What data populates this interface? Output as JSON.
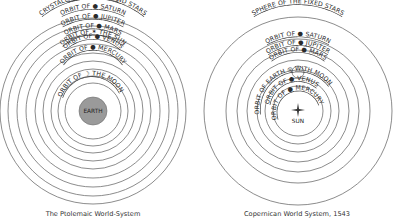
{
  "ptolemaic": {
    "caption": "The Ptolemaic World-System",
    "center_label": "EARTH",
    "earth_fill": "#9a9a9a",
    "rings": [
      {
        "label": "PRIMUM MOBILE"
      },
      {
        "label": "CRYSTALLINE HEAVENS AND STARS"
      },
      {
        "label": "ORBIT OF ● SATURN"
      },
      {
        "label": "ORBIT OF ● JUPITER"
      },
      {
        "label": "ORBIT OF ● MARS"
      },
      {
        "label": "ORBIT OF ✶ THE SUN"
      },
      {
        "label": "ORBIT OF ● VENUS"
      },
      {
        "label": "ORBIT OF ● MERCURY"
      },
      {
        "label": "ORBIT OF ☽ THE MOON"
      }
    ]
  },
  "copernican": {
    "caption": "Copernican World System, 1543",
    "center_label": "SUN",
    "rings": [
      {
        "label": "SPHERE OF THE FIXED STARS"
      },
      {
        "label": "ORBIT OF ● SATURN"
      },
      {
        "label": "ORBIT OF ● JUPITER"
      },
      {
        "label": "ORBIT OF ● MARS"
      },
      {
        "label": "ORBIT OF EARTH ◎ WITH MOON"
      },
      {
        "label": "ORBIT OF ● VENUS"
      },
      {
        "label": "ORBIT OF ● MERCURY"
      }
    ]
  }
}
